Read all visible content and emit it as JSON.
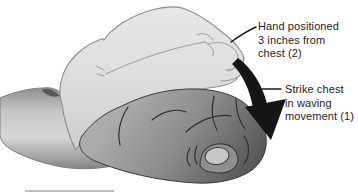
{
  "figure": {
    "annotations": {
      "hand_position": {
        "line1": "Hand positioned",
        "line2": "3 inches from",
        "line3": "chest (2)"
      },
      "strike": {
        "line1": "Strike chest",
        "line2": "in waving",
        "line3": "movement (1)"
      }
    },
    "icons": {
      "motion_arrow": "curved-arrow-down"
    },
    "colors": {
      "background": "#ffffff",
      "ghost_hand": "#dcdcdc",
      "forearm": "#c6c6c6",
      "striking_hand": "#7a7a7a",
      "outline": "#4a4a4a",
      "arrow": "#151515",
      "leader_line": "#1a1a1a",
      "text": "#1c1c1c",
      "bottom_rule": "#bfbfbf"
    }
  }
}
